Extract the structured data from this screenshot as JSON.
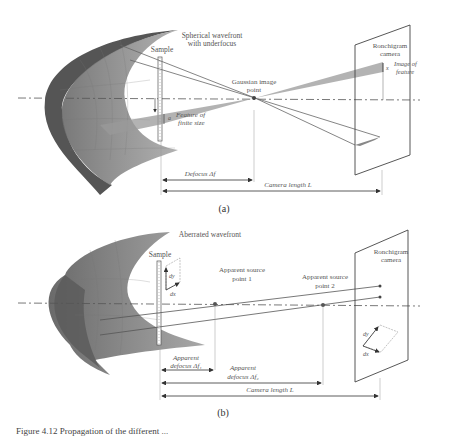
{
  "panel_a": {
    "wavefront_label_1": "Spherical wavefront",
    "wavefront_label_2": "with underfocus",
    "sample_label": "Sample",
    "feature_label_1": "Feature of",
    "feature_label_2": "finite size",
    "feature_symbol": "a",
    "gaussian_label_1": "Gaussian image",
    "gaussian_label_2": "point",
    "camera_label_1": "Ronchigram",
    "camera_label_2": "camera",
    "image_label_1": "Image of",
    "image_label_2": "feature",
    "image_symbol": "x",
    "defocus_label": "Defocus Δf",
    "camera_length_label": "Camera length L",
    "panel_tag": "(a)"
  },
  "panel_b": {
    "wavefront_label": "Aberrated wavefront",
    "sample_label": "Sample",
    "dy_label": "dy",
    "dx_label": "dx",
    "source1_label_1": "Apparent source",
    "source1_label_2": "point 1",
    "source2_label_1": "Apparent source",
    "source2_label_2": "point 2",
    "camera_label_1": "Ronchigram",
    "camera_label_2": "camera",
    "cam_dy_label": "dy",
    "cam_dx_label": "dx",
    "defocus1_label_1": "Apparent",
    "defocus1_label_2": "defocus Δf₁",
    "defocus2_label_1": "Apparent",
    "defocus2_label_2": "defocus Δf₂",
    "camera_length_label": "Camera length L",
    "panel_tag": "(b)"
  },
  "caption": "Figure 4.12   Propagation of the different ..."
}
